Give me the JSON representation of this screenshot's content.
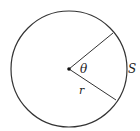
{
  "diagram": {
    "type": "circle-sector",
    "labels": {
      "angle": "θ",
      "arc": "S",
      "radius": "r"
    },
    "colors": {
      "stroke": "#333333",
      "background": "#ffffff"
    }
  }
}
